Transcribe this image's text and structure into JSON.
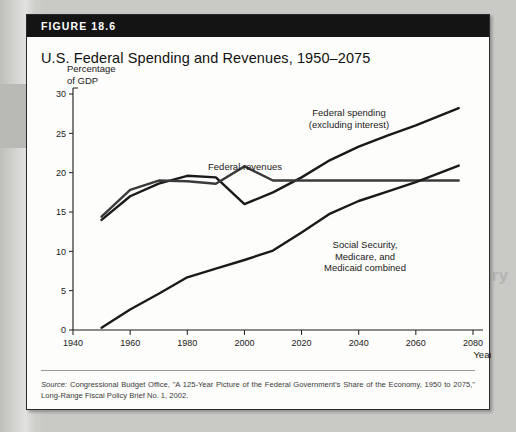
{
  "figure": {
    "badge": "FIGURE 18.6",
    "title": "U.S. Federal Spending and Revenues, 1950–2075",
    "source_word": "Source:",
    "source_text": " Congressional Budget Office, \"A 125-Year Picture of the Federal Government's Share of the Economy, 1950 to 2075,\" Long-Range Fiscal Policy Brief No. 1, 2002."
  },
  "ghost_text": {
    "line1": "of the",
    "line2": "Twenty-First Century",
    "line3": "fall of the"
  },
  "chart_data": {
    "type": "line",
    "title": "U.S. Federal Spending and Revenues, 1950–2075",
    "xlabel": "Year",
    "ylabel": "Percentage of GDP",
    "ylabel_line1": "Percentage",
    "ylabel_line2": "of GDP",
    "xlim": [
      1940,
      2080
    ],
    "ylim": [
      0,
      30
    ],
    "xticks": [
      1940,
      1960,
      1980,
      2000,
      2020,
      2040,
      2060,
      2080
    ],
    "yticks": [
      0,
      5,
      10,
      15,
      20,
      25,
      30
    ],
    "grid": false,
    "legend": "annotations",
    "series": [
      {
        "name": "Federal spending (excluding interest)",
        "label_line1": "Federal spending",
        "label_line2": "(excluding interest)",
        "color": "#1a1a1a",
        "x": [
          1950,
          1960,
          1970,
          1980,
          1990,
          2000,
          2010,
          2020,
          2030,
          2040,
          2050,
          2060,
          2075
        ],
        "y": [
          14.0,
          17.0,
          18.6,
          19.6,
          19.4,
          16.0,
          17.5,
          19.4,
          21.6,
          23.3,
          24.7,
          26.0,
          28.2
        ]
      },
      {
        "name": "Federal revenues",
        "label_line1": "Federal revenues",
        "color": "#3a3a3a",
        "x": [
          1950,
          1960,
          1970,
          1980,
          1990,
          2000,
          2010,
          2020,
          2040,
          2060,
          2075
        ],
        "y": [
          14.4,
          17.8,
          19.0,
          18.9,
          18.6,
          20.8,
          19.0,
          19.0,
          19.0,
          19.0,
          19.0
        ]
      },
      {
        "name": "Social Security, Medicare, and Medicaid combined",
        "label_line1": "Social Security,",
        "label_line2": "Medicare, and",
        "label_line3": "Medicaid combined",
        "color": "#1a1a1a",
        "x": [
          1950,
          1960,
          1970,
          1980,
          1990,
          2000,
          2010,
          2020,
          2030,
          2040,
          2050,
          2060,
          2075
        ],
        "y": [
          0.3,
          2.6,
          4.6,
          6.7,
          7.8,
          8.9,
          10.1,
          12.4,
          14.8,
          16.4,
          17.6,
          18.8,
          20.9
        ]
      }
    ]
  }
}
